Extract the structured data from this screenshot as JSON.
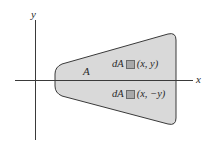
{
  "diagram": {
    "axes": {
      "x_label": "x",
      "y_label": "y"
    },
    "region": {
      "label": "A",
      "fill": "#d9d9d9",
      "stroke": "#3a3a3a"
    },
    "elements": [
      {
        "prefix": "dA",
        "coords": "(x, y)"
      },
      {
        "prefix": "dA",
        "coords": "(x, −y)"
      }
    ],
    "colors": {
      "axis": "#3a3a3a",
      "element_square": "#a8a8a8"
    }
  }
}
